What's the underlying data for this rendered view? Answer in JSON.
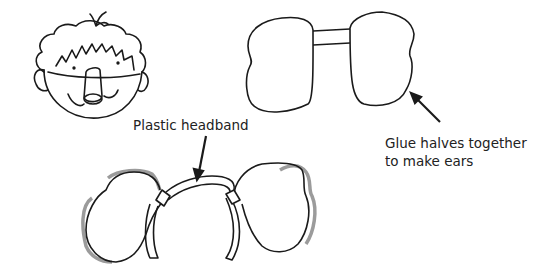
{
  "illustration": {
    "figures": [
      {
        "id": "child-face",
        "description": "Cartoon child face with messy hair, eyes, smile and tube nose"
      },
      {
        "id": "ear-halves",
        "description": "Two ear shapes joined by a strip"
      },
      {
        "id": "headband-assembly",
        "description": "Plastic headband with ears attached"
      }
    ]
  },
  "labels": {
    "headband": "Plastic headband",
    "glue_line1": "Glue halves together",
    "glue_line2": "to make ears"
  },
  "colors": {
    "ink": "#1a1a1a",
    "shadow": "#8a8a8a",
    "text": "#222222",
    "background": "#ffffff"
  }
}
